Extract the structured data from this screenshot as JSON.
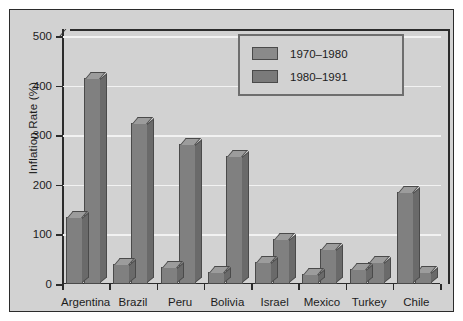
{
  "chart_data": {
    "type": "bar",
    "title": "",
    "subtitle": "",
    "xlabel": "",
    "ylabel": "Inflation Rate (%)",
    "categories": [
      "Argentina",
      "Brazil",
      "Peru",
      "Bolivia",
      "Israel",
      "Mexico",
      "Turkey",
      "Chile"
    ],
    "series": [
      {
        "name": "1970–1980",
        "values": [
          135,
          40,
          35,
          25,
          45,
          20,
          30,
          185
        ],
        "color": "#808080"
      },
      {
        "name": "1980–1991",
        "values": [
          415,
          325,
          283,
          258,
          90,
          70,
          45,
          25
        ],
        "color": "#808080"
      }
    ],
    "ylim": [
      0,
      500
    ],
    "yticks": [
      0,
      100,
      200,
      300,
      400,
      500
    ],
    "ytick_labels": [
      "0",
      "100",
      "200",
      "300",
      "400",
      "500"
    ],
    "grid": true,
    "grid_orientation": "horizontal",
    "grid_color": "#f2f2f2",
    "legend_position": "top-right",
    "legend_entries": [
      "1970–1980",
      "1980–1991"
    ],
    "style": "3d-bars",
    "panel_background": "#d2d2d2",
    "axis_color": "#2b2b2b",
    "text_color": "#1c1c1c"
  },
  "legend": {
    "entries": [
      {
        "label": "1970–1980"
      },
      {
        "label": "1980–1991"
      }
    ]
  },
  "axes": {
    "y_axis_title": "Inflation Rate (%)",
    "y_tick_labels": [
      "500",
      "400",
      "300",
      "200",
      "100",
      "0"
    ],
    "x_tick_labels": [
      "Argentina",
      "Brazil",
      "Peru",
      "Bolivia",
      "Israel",
      "Mexico",
      "Turkey",
      "Chile"
    ]
  }
}
